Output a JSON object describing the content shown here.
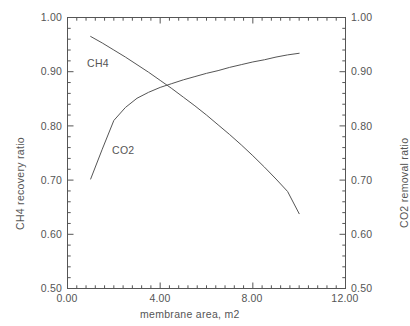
{
  "chart_data": {
    "type": "line",
    "title": "",
    "xlabel": "membrane area, m2",
    "ylabel": "CH4 recovery ratio",
    "y2label": "CO2 removal ratio",
    "xlim": [
      0.0,
      12.0
    ],
    "ylim": [
      0.5,
      1.0
    ],
    "y2lim": [
      0.5,
      1.0
    ],
    "grid": false,
    "legend_position": "inline-annotations",
    "xticks": [
      0.0,
      4.0,
      8.0,
      12.0
    ],
    "xticklabels": [
      "0.00",
      "4.00",
      "8.00",
      "12.00"
    ],
    "yticks": [
      0.5,
      0.6,
      0.7,
      0.8,
      0.9,
      1.0
    ],
    "yticklabels": [
      "0.50",
      "0.60",
      "0.70",
      "0.80",
      "0.90",
      "1.00"
    ],
    "y2ticks": [
      0.5,
      0.6,
      0.7,
      0.8,
      0.9,
      1.0
    ],
    "y2ticklabels": [
      "0.50",
      "0.60",
      "0.70",
      "0.80",
      "0.90",
      "1.00"
    ],
    "minor_ticks_per_major_x": 10,
    "minor_ticks_per_major_y": 5,
    "series": [
      {
        "name": "CH4",
        "axis": "left",
        "label_text": "CH4",
        "color": "#555555",
        "x": [
          1.0,
          1.5,
          2.0,
          2.5,
          3.0,
          3.5,
          4.0,
          4.5,
          5.0,
          5.5,
          6.0,
          6.5,
          7.0,
          7.5,
          8.0,
          8.5,
          9.0,
          9.5,
          10.0
        ],
        "y": [
          0.965,
          0.953,
          0.94,
          0.927,
          0.913,
          0.899,
          0.884,
          0.869,
          0.853,
          0.837,
          0.82,
          0.802,
          0.784,
          0.765,
          0.745,
          0.724,
          0.702,
          0.679,
          0.638
        ]
      },
      {
        "name": "CO2",
        "axis": "right",
        "label_text": "CO2",
        "color": "#555555",
        "x": [
          1.0,
          1.5,
          2.0,
          2.5,
          3.0,
          3.5,
          4.0,
          4.5,
          5.0,
          5.5,
          6.0,
          6.5,
          7.0,
          7.5,
          8.0,
          8.5,
          9.0,
          9.5,
          10.0
        ],
        "y": [
          0.702,
          0.757,
          0.81,
          0.834,
          0.851,
          0.862,
          0.871,
          0.878,
          0.885,
          0.891,
          0.897,
          0.902,
          0.908,
          0.913,
          0.918,
          0.922,
          0.927,
          0.931,
          0.934
        ]
      }
    ],
    "annotations": [
      {
        "text": "CH4",
        "x_data": 1.45,
        "y_data": 0.925
      },
      {
        "text": "CO2",
        "x_data": 2.55,
        "y_data": 0.745
      }
    ]
  },
  "axes": {
    "x_title": "membrane area, m2",
    "y_left_title": "CH4 recovery ratio",
    "y_right_title": "CO2 removal ratio",
    "x_tick_0": "0.00",
    "x_tick_1": "4.00",
    "x_tick_2": "8.00",
    "x_tick_3": "12.00",
    "y_tick_0": "1.00",
    "y_tick_1": "0.90",
    "y_tick_2": "0.80",
    "y_tick_3": "0.70",
    "y_tick_4": "0.60",
    "y_tick_5": "0.50",
    "y2_tick_0": "1.00",
    "y2_tick_1": "0.90",
    "y2_tick_2": "0.80",
    "y2_tick_3": "0.70",
    "y2_tick_4": "0.60",
    "y2_tick_5": "0.50"
  },
  "annotations": {
    "ch4_label": "CH4",
    "co2_label": "CO2"
  },
  "style": {
    "line_color": "#555555",
    "axis_color": "#555555",
    "text_color": "#555555",
    "background": "#ffffff"
  }
}
